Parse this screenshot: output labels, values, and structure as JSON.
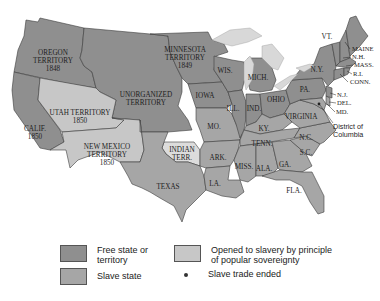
{
  "map": {
    "title": "Compromise of 1850 and Kansas-Nebraska era territories",
    "regions": [
      {
        "id": "oregon",
        "label_lines": [
          "OREGON",
          "TERRITORY",
          "1848"
        ],
        "status": "free"
      },
      {
        "id": "minnesota",
        "label_lines": [
          "MINNESOTA",
          "TERRITORY",
          "1849"
        ],
        "status": "free"
      },
      {
        "id": "unorganized",
        "label_lines": [
          "UNORGANIZED",
          "TERRITORY"
        ],
        "status": "free"
      },
      {
        "id": "utah",
        "label_lines": [
          "UTAH TERRITORY",
          "1850"
        ],
        "status": "popular_sovereignty"
      },
      {
        "id": "new_mexico",
        "label_lines": [
          "NEW MEXICO",
          "TERRITORY",
          "1850"
        ],
        "status": "popular_sovereignty"
      },
      {
        "id": "california",
        "label_lines": [
          "CALIF.",
          "1850"
        ],
        "status": "free"
      },
      {
        "id": "indian_terr",
        "label_lines": [
          "INDIAN",
          "TERR."
        ],
        "status": "other"
      },
      {
        "id": "texas",
        "label_lines": [
          "TEXAS"
        ],
        "status": "slave"
      },
      {
        "id": "wis",
        "label_lines": [
          "WIS."
        ],
        "status": "free"
      },
      {
        "id": "mich",
        "label_lines": [
          "MICH."
        ],
        "status": "free"
      },
      {
        "id": "iowa",
        "label_lines": [
          "IOWA"
        ],
        "status": "free"
      },
      {
        "id": "ill",
        "label_lines": [
          "ILL."
        ],
        "status": "free"
      },
      {
        "id": "ind",
        "label_lines": [
          "IND."
        ],
        "status": "free"
      },
      {
        "id": "ohio",
        "label_lines": [
          "OHIO"
        ],
        "status": "free"
      },
      {
        "id": "pa",
        "label_lines": [
          "PA."
        ],
        "status": "free"
      },
      {
        "id": "ny",
        "label_lines": [
          "N.Y."
        ],
        "status": "free"
      },
      {
        "id": "vt",
        "label_lines": [
          "VT."
        ],
        "status": "free"
      },
      {
        "id": "maine",
        "label_lines": [
          "MAINE"
        ],
        "status": "free"
      },
      {
        "id": "nh",
        "label_lines": [
          "N.H."
        ],
        "status": "free"
      },
      {
        "id": "mass",
        "label_lines": [
          "MASS."
        ],
        "status": "free"
      },
      {
        "id": "ri",
        "label_lines": [
          "R.I."
        ],
        "status": "free"
      },
      {
        "id": "conn",
        "label_lines": [
          "CONN."
        ],
        "status": "free"
      },
      {
        "id": "nj",
        "label_lines": [
          "N.J."
        ],
        "status": "free"
      },
      {
        "id": "del",
        "label_lines": [
          "DEL."
        ],
        "status": "slave"
      },
      {
        "id": "md",
        "label_lines": [
          "MD."
        ],
        "status": "slave"
      },
      {
        "id": "dc",
        "label_lines": [
          "District of",
          "Columbia"
        ],
        "status": "slave_trade_ended"
      },
      {
        "id": "virginia",
        "label_lines": [
          "VIRGINIA"
        ],
        "status": "slave"
      },
      {
        "id": "mo",
        "label_lines": [
          "MO."
        ],
        "status": "slave"
      },
      {
        "id": "ky",
        "label_lines": [
          "KY."
        ],
        "status": "slave"
      },
      {
        "id": "tenn",
        "label_lines": [
          "TENN."
        ],
        "status": "slave"
      },
      {
        "id": "nc",
        "label_lines": [
          "N.C."
        ],
        "status": "slave"
      },
      {
        "id": "sc",
        "label_lines": [
          "S.C."
        ],
        "status": "slave"
      },
      {
        "id": "ga",
        "label_lines": [
          "GA."
        ],
        "status": "slave"
      },
      {
        "id": "ala",
        "label_lines": [
          "ALA."
        ],
        "status": "slave"
      },
      {
        "id": "miss",
        "label_lines": [
          "MISS."
        ],
        "status": "slave"
      },
      {
        "id": "ark",
        "label_lines": [
          "ARK."
        ],
        "status": "slave"
      },
      {
        "id": "la",
        "label_lines": [
          "LA."
        ],
        "status": "slave"
      },
      {
        "id": "fla",
        "label_lines": [
          "FLA."
        ],
        "status": "slave"
      }
    ]
  },
  "legend": {
    "items": [
      {
        "label": "Free state or territory",
        "line1": "Free state or",
        "line2": "territory",
        "color": "#8f8f8f"
      },
      {
        "label": "Slave state",
        "line1": "Slave state",
        "color": "#a6a6a6"
      },
      {
        "label": "Opened to slavery by principle of popular sovereignty",
        "line1": "Opened to slavery by principle",
        "line2": "of popular sovereignty",
        "color": "#c7c7c7"
      },
      {
        "label": "Slave trade ended",
        "line1": "Slave trade ended",
        "symbol": "dot"
      }
    ]
  },
  "colors": {
    "free": "#8f8f8f",
    "slave": "#a6a6a6",
    "popular_sovereignty": "#c7c7c7",
    "indian_territory": "#dcdcdc",
    "lakes": "#d8d8d8",
    "borders": "#3c3c3c"
  }
}
